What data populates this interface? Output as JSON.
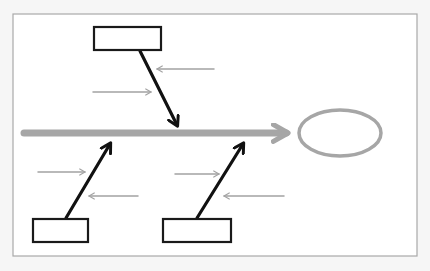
{
  "diagram": {
    "type": "fishbone-sketch",
    "colors": {
      "page_background": "#f6f6f6",
      "frame_fill": "#ffffff",
      "frame_stroke": "#a9a9a9",
      "spine": "#a6a6a6",
      "bone": "#111111",
      "sub_cause": "#a3a3a3",
      "head": "#a6a6a6",
      "box_stroke": "#1a1a1a"
    },
    "frame": {
      "x": 13,
      "y": 14,
      "width": 404,
      "height": 242
    },
    "spine": {
      "x1": 24,
      "y1": 133,
      "x2": 286,
      "y2": 133
    },
    "head": {
      "cx": 340,
      "cy": 133,
      "rx": 41,
      "ry": 23
    },
    "cause_boxes": [
      {
        "id": "top-cause-box",
        "x": 94,
        "y": 27,
        "width": 67,
        "height": 23,
        "label": ""
      },
      {
        "id": "bottom-left-cause-box",
        "x": 33,
        "y": 219,
        "width": 55,
        "height": 23,
        "label": ""
      },
      {
        "id": "bottom-right-cause-box",
        "x": 163,
        "y": 219,
        "width": 68,
        "height": 23,
        "label": ""
      }
    ],
    "bones": [
      {
        "id": "top-bone",
        "x1": 140,
        "y1": 51,
        "x2": 177,
        "y2": 125
      },
      {
        "id": "bottom-left-bone",
        "x1": 66,
        "y1": 218,
        "x2": 110,
        "y2": 144
      },
      {
        "id": "bottom-right-bone",
        "x1": 197,
        "y1": 218,
        "x2": 243,
        "y2": 144
      }
    ],
    "sub_causes": [
      {
        "id": "sub-cause-1",
        "x1": 214,
        "y1": 69,
        "x2": 157,
        "y2": 69
      },
      {
        "id": "sub-cause-2",
        "x1": 93,
        "y1": 92,
        "x2": 151,
        "y2": 92
      },
      {
        "id": "sub-cause-3",
        "x1": 38,
        "y1": 172,
        "x2": 85,
        "y2": 172
      },
      {
        "id": "sub-cause-4",
        "x1": 138,
        "y1": 196,
        "x2": 89,
        "y2": 196
      },
      {
        "id": "sub-cause-5",
        "x1": 175,
        "y1": 174,
        "x2": 219,
        "y2": 174
      },
      {
        "id": "sub-cause-6",
        "x1": 284,
        "y1": 196,
        "x2": 224,
        "y2": 196
      }
    ]
  }
}
